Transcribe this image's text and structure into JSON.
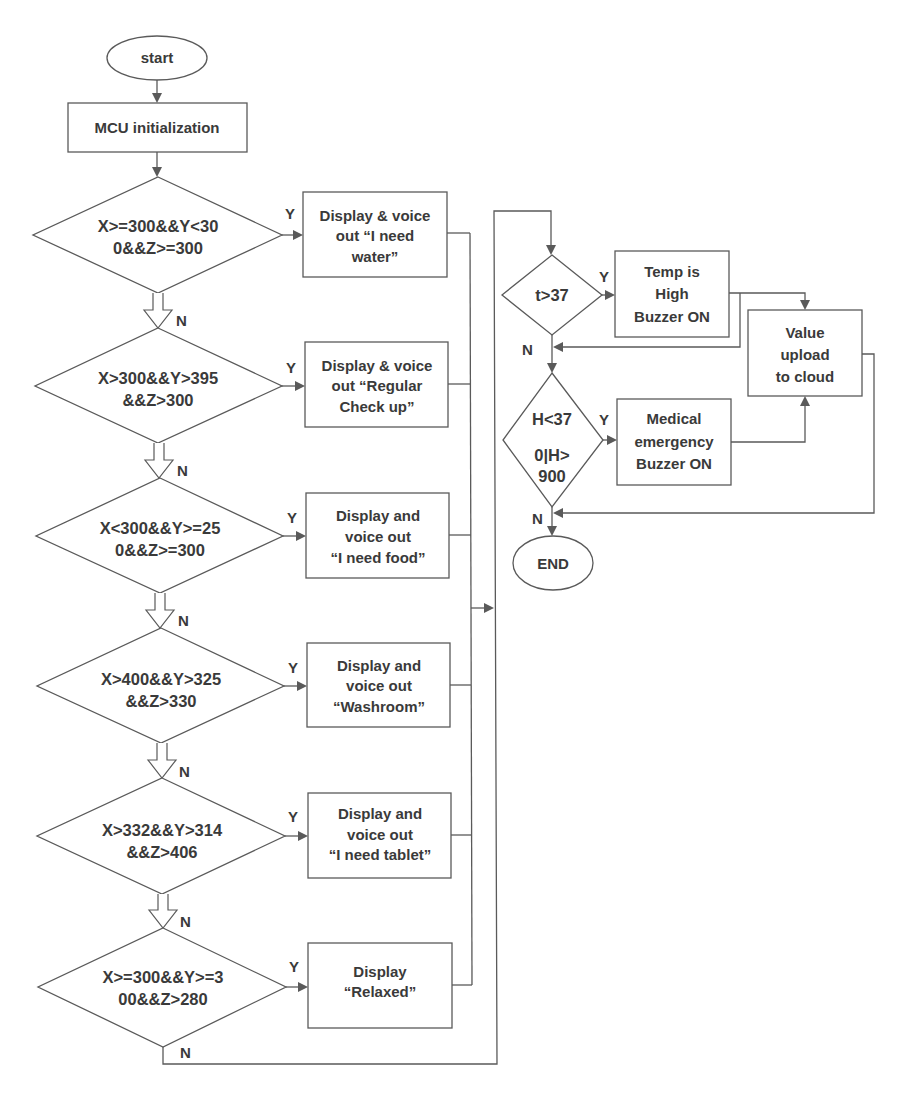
{
  "figure": {
    "start_label": "start",
    "init_label": "MCU initialization",
    "gesture_checks": [
      {
        "condition": [
          "X>=300&&Y<30",
          "0&&Z>=300"
        ],
        "yes_label": "Y",
        "no_label": "N",
        "action": [
          "Display & voice",
          "out “I need",
          "water”"
        ]
      },
      {
        "condition": [
          "X>300&&Y>395",
          "&&Z>300"
        ],
        "yes_label": "Y",
        "no_label": "N",
        "action": [
          "Display & voice",
          "out “Regular",
          "Check up”"
        ]
      },
      {
        "condition": [
          "X<300&&Y>=25",
          "0&&Z>=300"
        ],
        "yes_label": "Y",
        "no_label": "N",
        "action": [
          "Display and",
          "voice out",
          "“I need food”"
        ]
      },
      {
        "condition": [
          "X>400&&Y>325",
          "&&Z>330"
        ],
        "yes_label": "Y",
        "no_label": "N",
        "action": [
          "Display and",
          "voice out",
          "“Washroom”"
        ]
      },
      {
        "condition": [
          "X>332&&Y>314",
          "&&Z>406"
        ],
        "yes_label": "Y",
        "no_label": "N",
        "action": [
          "Display and",
          "voice out",
          "“I need tablet”"
        ]
      },
      {
        "condition": [
          "X>=300&&Y>=3",
          "00&&Z>280"
        ],
        "yes_label": "Y",
        "no_label": "N",
        "action": [
          "Display",
          "“Relaxed”"
        ]
      }
    ],
    "temperature_check": {
      "condition": [
        "t>37"
      ],
      "yes_label": "Y",
      "no_label": "N",
      "action": [
        "Temp is",
        "High",
        "Buzzer ON"
      ]
    },
    "heart_rate_check": {
      "condition": [
        "H<37",
        "0|H>",
        "900"
      ],
      "yes_label": "Y",
      "no_label": "N",
      "action": [
        "Medical",
        "emergency",
        "Buzzer ON"
      ]
    },
    "upload_label": [
      "Value",
      "upload",
      "to cloud"
    ],
    "end_label": "END"
  },
  "colors": {
    "stroke": "#5a5a5a",
    "text": "#3a3a3a",
    "background": "#ffffff"
  }
}
